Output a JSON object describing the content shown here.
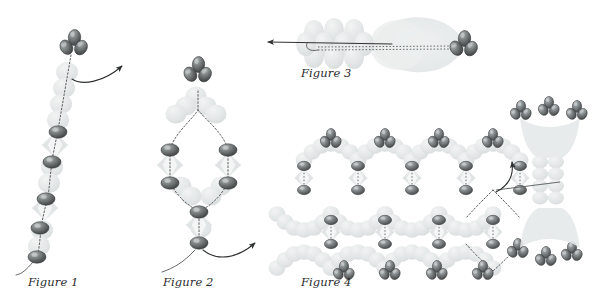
{
  "document": {
    "title": "Molecular assembly figures",
    "background_color": "#ffffff",
    "width": 603,
    "height": 305
  },
  "palette": {
    "bead_dark": "#6b6f70",
    "bead_dark_edge": "#3c4041",
    "bead_highlight": "#b9bdbe",
    "ghost_fill": "#e2e6e6",
    "ghost_fill_light": "#eceeee",
    "envelope_fill": "#e8ebeb",
    "connector": "#4a4e4f",
    "arrow": "#2f3233",
    "caption_text": "#2b2b2b"
  },
  "figures": [
    {
      "id": "figure-1",
      "caption": "Figure 1",
      "description": "Single extended strand of beads with terminal trefoil cluster and curved arrow",
      "caption_position": {
        "x": 28,
        "y": 275
      }
    },
    {
      "id": "figure-2",
      "caption": "Figure 2",
      "description": "Closed loop (lariat) of beads with trefoil cluster at top and tail with curved arrow at bottom",
      "caption_position": {
        "x": 163,
        "y": 275
      }
    },
    {
      "id": "figure-3",
      "caption": "Figure 3",
      "description": "Edge-on view of strand with long straight arrow pointing left and trefoil cluster at right",
      "caption_position": {
        "x": 301,
        "y": 66
      }
    },
    {
      "id": "figure-4",
      "caption": "Figure 4",
      "description": "Two-dimensional lattice network of diamond cells with trefoil clusters, highlighted cell, and side-view column at right",
      "caption_position": {
        "x": 301,
        "y": 275
      }
    }
  ],
  "annotations": {
    "arrow_figure_1": "curved arrow pointing up-right from top cluster",
    "arrow_figure_2": "curved arrow pointing up-right from bottom bead",
    "arrow_figure_3": "straight arrow pointing left along the strand axis",
    "arrow_figure_4": "curved arrow pointing up from highlighted lattice cell, plus straight pointer to column"
  }
}
